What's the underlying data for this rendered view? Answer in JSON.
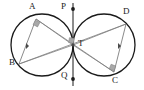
{
  "figure": {
    "background_color": "#ffffff",
    "stroke_color": "#1a1a1a",
    "thin_stroke_color": "#6e6e6e",
    "marker_fill_color": "#9a9a9a",
    "width": 144,
    "height": 90
  },
  "labels": {
    "A": "A",
    "B": "B",
    "C": "C",
    "D": "D",
    "P": "P",
    "Q": "Q",
    "T": "T"
  },
  "points": {
    "A": {
      "label": "A",
      "x": 36,
      "y": 19,
      "label_x": 29,
      "label_y": 2
    },
    "B": {
      "label": "B",
      "x": 19,
      "y": 64,
      "label_x": 9,
      "label_y": 58
    },
    "C": {
      "label": "C",
      "x": 114,
      "y": 72,
      "label_x": 112,
      "label_y": 76
    },
    "D": {
      "label": "D",
      "x": 126,
      "y": 24,
      "label_x": 123,
      "label_y": 7
    },
    "P": {
      "label": "P",
      "x": 73,
      "y": 9,
      "label_x": 60,
      "label_y": 3
    },
    "Q": {
      "label": "Q",
      "x": 73,
      "y": 79,
      "label_x": 60,
      "label_y": 70
    },
    "T": {
      "label": "T",
      "x": 73,
      "y": 45,
      "label_x": 78,
      "label_y": 39
    }
  },
  "circles": [
    {
      "name": "left-circle",
      "cx": 42,
      "cy": 45,
      "r": 31
    },
    {
      "name": "right-circle",
      "cx": 104,
      "cy": 45,
      "r": 31
    }
  ],
  "tangent_line": {
    "name": "common-tangent",
    "x": 73,
    "y_top": 3,
    "y_bottom": 86
  },
  "segments": [
    {
      "name": "segment-A-T",
      "from": "A",
      "to": "T"
    },
    {
      "name": "segment-B-T",
      "from": "B",
      "to": "T"
    },
    {
      "name": "segment-C-T",
      "from": "C",
      "to": "T"
    },
    {
      "name": "segment-D-T",
      "from": "D",
      "to": "T"
    },
    {
      "name": "segment-A-B",
      "from": "A",
      "to": "B"
    },
    {
      "name": "segment-C-D",
      "from": "C",
      "to": "D"
    },
    {
      "name": "segment-B-D",
      "from": "B",
      "to": "D"
    },
    {
      "name": "segment-A-C",
      "from": "A",
      "to": "C"
    }
  ],
  "right_angle_markers": [
    {
      "name": "right-angle-at-A",
      "x": 36,
      "y": 19
    },
    {
      "name": "right-angle-at-C",
      "x": 114,
      "y": 72
    },
    {
      "name": "right-angle-at-T",
      "x": 73,
      "y": 41
    }
  ],
  "tick_markers": [
    {
      "name": "tick-left-radius",
      "x": 27,
      "y": 46
    },
    {
      "name": "tick-right-radius",
      "x": 119,
      "y": 46
    }
  ],
  "point_dots": [
    {
      "name": "dot-P",
      "x": 73,
      "y": 9
    },
    {
      "name": "dot-Q",
      "x": 73,
      "y": 79
    },
    {
      "name": "dot-T",
      "x": 73,
      "y": 45
    }
  ]
}
